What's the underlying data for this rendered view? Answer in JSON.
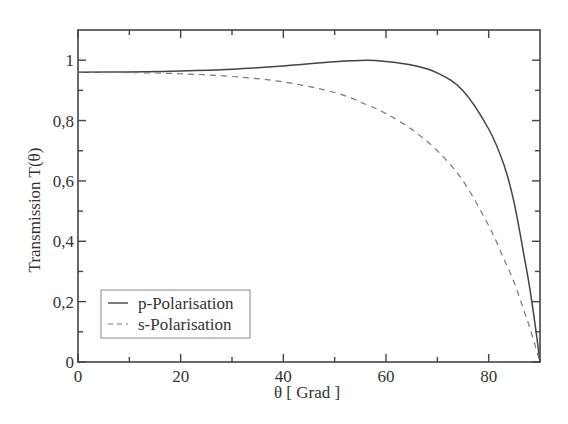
{
  "chart_data": {
    "type": "line",
    "title": "",
    "xlabel": "θ [ Grad ]",
    "ylabel": "Transmission  T(θ)",
    "xlim": [
      0,
      90
    ],
    "ylim": [
      0,
      1.1
    ],
    "xticks": [
      0,
      20,
      40,
      60,
      80
    ],
    "xtick_labels": [
      "0",
      "20",
      "40",
      "60",
      "80"
    ],
    "xminor": [
      10,
      30,
      50,
      70
    ],
    "yticks": [
      0,
      0.2,
      0.4,
      0.6,
      0.8,
      1.0
    ],
    "ytick_labels": [
      "0",
      "0,2",
      "0,4",
      "0,6",
      "0,8",
      "1"
    ],
    "yminor": [
      0.1,
      0.3,
      0.5,
      0.7,
      0.9
    ],
    "grid": false,
    "legend_position": "lower left",
    "x": [
      0,
      10,
      20,
      30,
      40,
      50,
      56.3,
      60,
      65,
      70,
      75,
      80,
      83,
      85,
      87,
      88,
      89,
      90
    ],
    "series": [
      {
        "name": "p-Polarisation",
        "style": "solid",
        "color": "#444444",
        "values": [
          0.96,
          0.961,
          0.964,
          0.97,
          0.981,
          0.995,
          1.0,
          0.996,
          0.984,
          0.958,
          0.899,
          0.772,
          0.652,
          0.525,
          0.342,
          0.245,
          0.13,
          0.0
        ]
      },
      {
        "name": "s-Polarisation",
        "style": "dashed",
        "color": "#777777",
        "values": [
          0.96,
          0.959,
          0.955,
          0.946,
          0.928,
          0.893,
          0.852,
          0.823,
          0.771,
          0.7,
          0.6,
          0.452,
          0.34,
          0.262,
          0.164,
          0.114,
          0.058,
          0.0
        ]
      }
    ]
  },
  "legend": {
    "items": [
      {
        "label": "p-Polarisation",
        "style": "solid"
      },
      {
        "label": "s-Polarisation",
        "style": "dashed"
      }
    ]
  }
}
